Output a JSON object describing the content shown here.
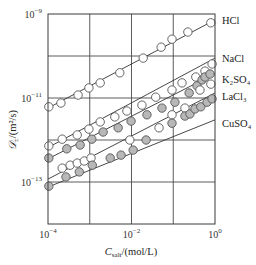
{
  "chart_data": {
    "type": "scatter",
    "title": "",
    "xlabel": "C_salt/(mol/L)",
    "xlabel_main": "C",
    "xlabel_sub": "salt",
    "xlabel_unit": "/(mol/L)",
    "ylabel": "𝒟±/(m²/s)",
    "ylabel_main": "𝒟",
    "ylabel_sub": "±",
    "ylabel_unit": "/(m²/s)",
    "xscale": "log",
    "yscale": "log",
    "xlim": [
      0.0001,
      1
    ],
    "ylim": [
      1e-14,
      1e-09
    ],
    "grid": true,
    "x_ticks": [
      {
        "base": "10",
        "exp": "−4",
        "log": -4
      },
      {
        "base": "10",
        "exp": "−2",
        "log": -2
      },
      {
        "base": "10",
        "exp": "0",
        "log": 0
      }
    ],
    "x_gridlines_log": [
      -3,
      -1
    ],
    "y_ticks": [
      {
        "base": "10",
        "exp": "−9",
        "log": -9
      },
      {
        "base": "10",
        "exp": "−11",
        "log": -11
      },
      {
        "base": "10",
        "exp": "−13",
        "log": -13
      }
    ],
    "y_gridlines_log": [
      -10,
      -12
    ],
    "legend_position": "right, inline labels at line ends",
    "series": [
      {
        "name": "HCl",
        "marker": "open-circle",
        "fill": "#ffffff",
        "label_log_y": -9.15,
        "fit_line": {
          "log_x": [
            -4,
            0
          ],
          "log_y": [
            -11.24,
            -9.14
          ]
        },
        "log_x": [
          -3.98,
          -3.69,
          -3.28,
          -3.02,
          -2.75,
          -2.28,
          -1.72,
          -1.29,
          -1.03,
          -0.65,
          -0.1
        ],
        "log_y": [
          -11.21,
          -11.12,
          -10.93,
          -10.76,
          -10.64,
          -10.4,
          -10.05,
          -9.79,
          -9.6,
          -9.43,
          -9.21
        ]
      },
      {
        "name": "NaCl",
        "marker": "open-circle",
        "fill": "#ffffff",
        "label_log_y": -10.05,
        "fit_line": {
          "log_x": [
            -4,
            0
          ],
          "log_y": [
            -12.18,
            -10.05
          ]
        },
        "log_x": [
          -3.98,
          -3.66,
          -3.3,
          -3.02,
          -2.75,
          -2.4,
          -2.11,
          -1.75,
          -1.42,
          -1.03,
          -0.79,
          -0.46,
          -0.24,
          -0.07
        ],
        "log_y": [
          -12.14,
          -11.98,
          -11.88,
          -11.74,
          -11.57,
          -11.45,
          -11.31,
          -11.17,
          -10.98,
          -10.81,
          -10.64,
          -10.5,
          -10.36,
          -10.19
        ]
      },
      {
        "name": "K₂SO₄",
        "marker": "filled-circle",
        "fill": "#b8b8b8",
        "label_log_y": -10.55,
        "fit_line": {
          "log_x": [
            -4,
            0
          ],
          "log_y": [
            -12.45,
            -10.42
          ]
        },
        "log_x": [
          -3.98,
          -3.55,
          -3.23,
          -2.95,
          -2.68,
          -2.32,
          -2.01,
          -1.63,
          -1.27,
          -0.96,
          -0.62,
          -0.43,
          -0.31,
          -0.24,
          -0.12
        ],
        "log_y": [
          -12.43,
          -12.21,
          -12.12,
          -11.98,
          -11.81,
          -11.71,
          -11.55,
          -11.4,
          -11.24,
          -11.1,
          -10.88,
          -10.71,
          -10.57,
          -10.5,
          -10.43
        ]
      },
      {
        "name": "LaCl₃",
        "marker": "open-circle",
        "fill": "#ffffff",
        "label_log_y": -10.95,
        "fit_line": {
          "log_x": [
            -4,
            0
          ],
          "log_y": [
            -12.93,
            -10.88
          ]
        },
        "log_x": [
          -3.66,
          -3.47,
          -3.3,
          -3.13,
          -2.97,
          -2.04,
          -1.34,
          -1.03,
          -0.72,
          -0.36,
          -0.1
        ],
        "log_y": [
          -12.67,
          -12.6,
          -12.55,
          -12.5,
          -12.43,
          -12.0,
          -11.71,
          -11.4,
          -11.24,
          -10.81,
          -10.67
        ]
      },
      {
        "name": "CuSO₄",
        "marker": "filled-circle",
        "fill": "#b8b8b8",
        "label_log_y": -11.6,
        "fit_line": {
          "log_x": [
            -4,
            0
          ],
          "log_y": [
            -13.12,
            -11.52
          ]
        },
        "log_x": [
          -3.98,
          -3.57,
          -3.25,
          -2.94,
          -2.51,
          -2.25,
          -1.96,
          -1.65,
          -1.03,
          -0.72,
          -0.6,
          -0.48,
          -0.34,
          -0.19,
          -0.07
        ],
        "log_y": [
          -13.1,
          -12.88,
          -12.76,
          -12.6,
          -12.43,
          -12.36,
          -12.24,
          -12.0,
          -11.6,
          -11.43,
          -11.38,
          -11.26,
          -11.21,
          -11.1,
          -11.02
        ]
      }
    ]
  },
  "colors": {
    "axis": "#3a3a3a",
    "grid": "#4a4a4a",
    "line": "#333333",
    "marker_stroke": "#555555",
    "filled_marker": "#b8b8b8",
    "open_marker": "#ffffff"
  }
}
